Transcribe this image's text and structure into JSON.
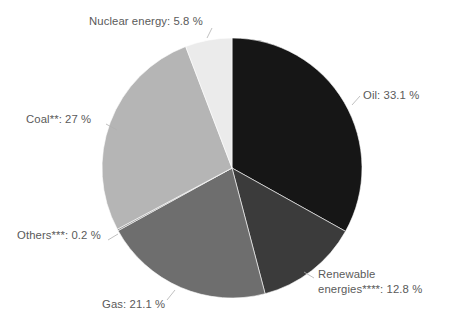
{
  "chart_data": {
    "type": "pie",
    "title": "",
    "subtitle": "",
    "xlabel": "",
    "ylabel": "",
    "grid": false,
    "legend_position": "none",
    "label_format": "{name}: {value} %",
    "unit": "%",
    "total": 100.0,
    "start_angle_deg": 0,
    "direction": "clockwise",
    "categories": [
      "Oil",
      "Renewable energies****",
      "Gas",
      "Others***",
      "Coal**",
      "Nuclear energy"
    ],
    "values": [
      33.1,
      12.8,
      21.1,
      0.2,
      27.0,
      5.8
    ],
    "colors": [
      "#161616",
      "#3b3b3b",
      "#6e6e6e",
      "#8f8f8f",
      "#b5b5b5",
      "#ebebeb"
    ],
    "slices": [
      {
        "name": "Oil",
        "value": 33.1,
        "label": "Oil: 33.1 %",
        "color": "#161616",
        "footnote_markers": ""
      },
      {
        "name": "Renewable energies",
        "value": 12.8,
        "label_line1": "Renewable",
        "label_line2": "energies****: 12.8 %",
        "color": "#3b3b3b",
        "footnote_markers": "****"
      },
      {
        "name": "Gas",
        "value": 21.1,
        "label": "Gas: 21.1 %",
        "color": "#6e6e6e",
        "footnote_markers": ""
      },
      {
        "name": "Others",
        "value": 0.2,
        "label": "Others***: 0.2 %",
        "color": "#8f8f8f",
        "footnote_markers": "***"
      },
      {
        "name": "Coal",
        "value": 27.0,
        "label": "Coal**: 27 %",
        "color": "#b5b5b5",
        "footnote_markers": "**"
      },
      {
        "name": "Nuclear energy",
        "value": 5.8,
        "label": "Nuclear energy: 5.8 %",
        "color": "#ebebeb",
        "footnote_markers": ""
      }
    ]
  },
  "labels": {
    "oil": "Oil: 33.1 %",
    "renewable_line1": "Renewable",
    "renewable_line2": "energies****: 12.8 %",
    "gas": "Gas: 21.1 %",
    "others": "Others***: 0.2 %",
    "coal": "Coal**: 27 %",
    "nuclear": "Nuclear energy: 5.8 %"
  },
  "style": {
    "background": "#ffffff",
    "label_color": "#5a5a5a",
    "leader_color": "#b0b0b0",
    "slice_border": "#ffffff"
  },
  "geometry": {
    "center_x": 232,
    "center_y": 168,
    "radius": 130
  }
}
